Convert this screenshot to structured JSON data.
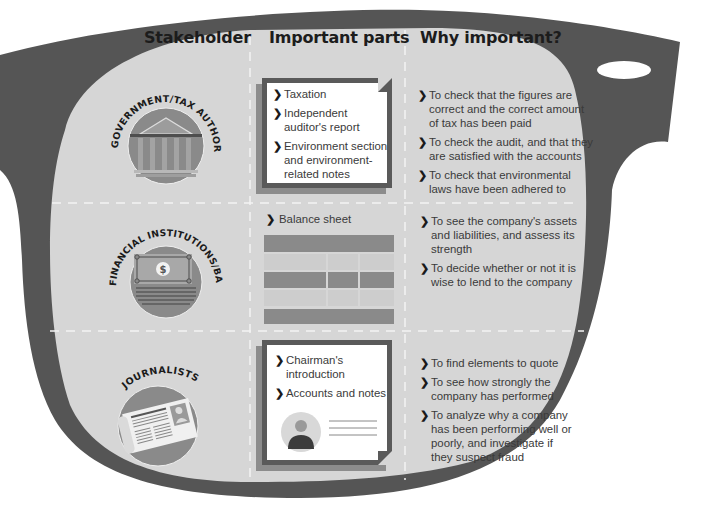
{
  "headers": {
    "stakeholder": "Stakeholder",
    "important_parts": "Important parts",
    "why_important": "Why important?"
  },
  "rows": [
    {
      "stakeholder": "GOVERNMENT/TAX AUTHORITIES",
      "icon": "government-building-icon",
      "parts": [
        "Taxation",
        "Independent auditor's report",
        "Environment section and environment-related notes"
      ],
      "parts_lines": [
        [
          "Taxation"
        ],
        [
          "Independent",
          "auditor's report"
        ],
        [
          "Environment section",
          "and environment-",
          "related notes"
        ]
      ],
      "reasons": [
        [
          "To check that the figures are",
          "correct and the correct amount",
          "of tax has been paid"
        ],
        [
          "To check the audit, and that they",
          "are satisfied with the accounts"
        ],
        [
          "To check that environmental",
          "laws have been adhered to"
        ]
      ]
    },
    {
      "stakeholder": "FINANCIAL INSTITUTIONS/BANKS",
      "icon": "banknote-icon",
      "parts": [
        "Balance sheet"
      ],
      "reasons": [
        [
          "To see the company's assets",
          "and liabilities, and assess its",
          "strength"
        ],
        [
          "To decide whether or not it is",
          "wise to lend to the company"
        ]
      ]
    },
    {
      "stakeholder": "JOURNALISTS",
      "icon": "newspaper-icon",
      "parts": [
        "Chairman's introduction",
        "Accounts and notes"
      ],
      "parts_lines": [
        [
          "Chairman's",
          "introduction"
        ],
        [
          "Accounts and notes"
        ]
      ],
      "reasons": [
        [
          "To find elements to quote"
        ],
        [
          "To see how strongly the",
          "company has performed"
        ],
        [
          "To analyze why a company",
          "has been performing well or",
          "poorly, and investigate if",
          "they suspect fraud"
        ]
      ]
    }
  ],
  "glyphs": {
    "chevron": "❯",
    "dollar": "$"
  },
  "colors": {
    "frame": "#555555",
    "lens": "#d6d6d6",
    "icon_circle": "#8a8a8a",
    "icon_dark": "#5e5e5e",
    "divider": "#f2f2f2"
  }
}
